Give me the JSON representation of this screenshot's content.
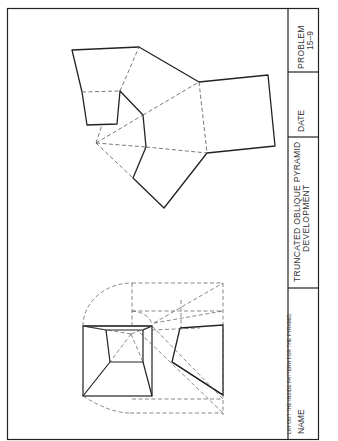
{
  "sheet": {
    "instruction": "LAY OUT THE INSIDE PATTERN FOR THE PYRAMID.",
    "title_line1": "TRUNCATED OBLIQUE PYRAMID",
    "title_line2": "DEVELOPMENT",
    "name_label": "NAME",
    "date_label": "DATE",
    "problem_label": "PROBLEM",
    "problem_number": "15–9"
  },
  "colors": {
    "line": "#222222",
    "hidden": "#555555",
    "background": "#ffffff"
  }
}
